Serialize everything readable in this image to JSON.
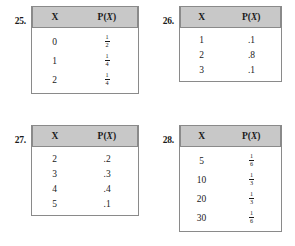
{
  "page": {
    "kind": "exercise-set",
    "columns": 2,
    "header_fill": "#c8c8c8",
    "border_color": "#8a8a8a",
    "text_color": "#1a1a1a"
  },
  "headers": {
    "x": "X",
    "px_prefix": "P(",
    "px_var": "X",
    "px_suffix": ")"
  },
  "problems": [
    {
      "number": "25.",
      "columns": [
        "X",
        "P(X)"
      ],
      "rows": [
        {
          "x": "0",
          "p_type": "fraction",
          "p_num": "1",
          "p_den": "2",
          "p_text": "1/2"
        },
        {
          "x": "1",
          "p_type": "fraction",
          "p_num": "1",
          "p_den": "4",
          "p_text": "1/4"
        },
        {
          "x": "2",
          "p_type": "fraction",
          "p_num": "1",
          "p_den": "4",
          "p_text": "1/4"
        }
      ]
    },
    {
      "number": "26.",
      "columns": [
        "X",
        "P(X)"
      ],
      "rows": [
        {
          "x": "1",
          "p_type": "decimal",
          "p_text": ".1"
        },
        {
          "x": "2",
          "p_type": "decimal",
          "p_text": ".8"
        },
        {
          "x": "3",
          "p_type": "decimal",
          "p_text": ".1"
        }
      ]
    },
    {
      "number": "27.",
      "columns": [
        "X",
        "P(X)"
      ],
      "rows": [
        {
          "x": "2",
          "p_type": "decimal",
          "p_text": ".2"
        },
        {
          "x": "3",
          "p_type": "decimal",
          "p_text": ".3"
        },
        {
          "x": "4",
          "p_type": "decimal",
          "p_text": ".4"
        },
        {
          "x": "5",
          "p_type": "decimal",
          "p_text": ".1"
        }
      ]
    },
    {
      "number": "28.",
      "columns": [
        "X",
        "P(X)"
      ],
      "rows": [
        {
          "x": "5",
          "p_type": "fraction",
          "p_num": "1",
          "p_den": "6",
          "p_text": "1/6"
        },
        {
          "x": "10",
          "p_type": "fraction",
          "p_num": "1",
          "p_den": "3",
          "p_text": "1/3"
        },
        {
          "x": "20",
          "p_type": "fraction",
          "p_num": "1",
          "p_den": "3",
          "p_text": "1/3"
        },
        {
          "x": "30",
          "p_type": "fraction",
          "p_num": "1",
          "p_den": "6",
          "p_text": "1/6"
        }
      ]
    }
  ]
}
